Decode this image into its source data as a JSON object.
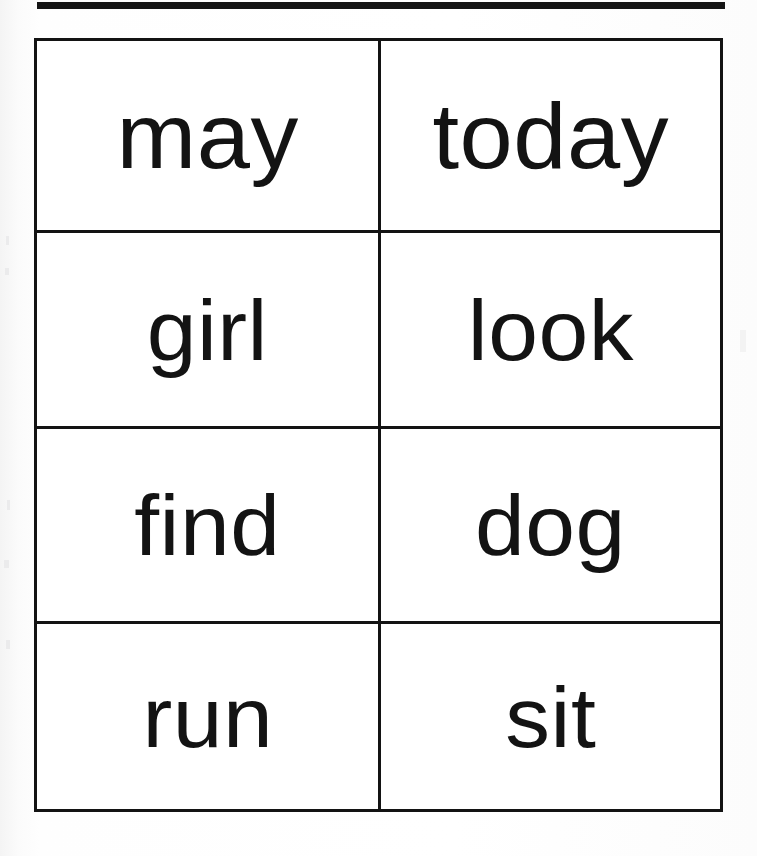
{
  "sheet": {
    "title": "Sight Word Flashcard Sheet",
    "rule_color": "#151313",
    "border_color": "#131313",
    "text_color": "#131313",
    "background_color": "#ffffff"
  },
  "grid": {
    "columns": 2,
    "rows": 4,
    "cells": [
      {
        "word": "may",
        "row": 1,
        "column": 1
      },
      {
        "word": "today",
        "row": 1,
        "column": 2
      },
      {
        "word": "girl",
        "row": 2,
        "column": 1
      },
      {
        "word": "look",
        "row": 2,
        "column": 2
      },
      {
        "word": "find",
        "row": 3,
        "column": 1
      },
      {
        "word": "dog",
        "row": 3,
        "column": 2
      },
      {
        "word": "run",
        "row": 4,
        "column": 1
      },
      {
        "word": "sit",
        "row": 4,
        "column": 2
      }
    ]
  }
}
